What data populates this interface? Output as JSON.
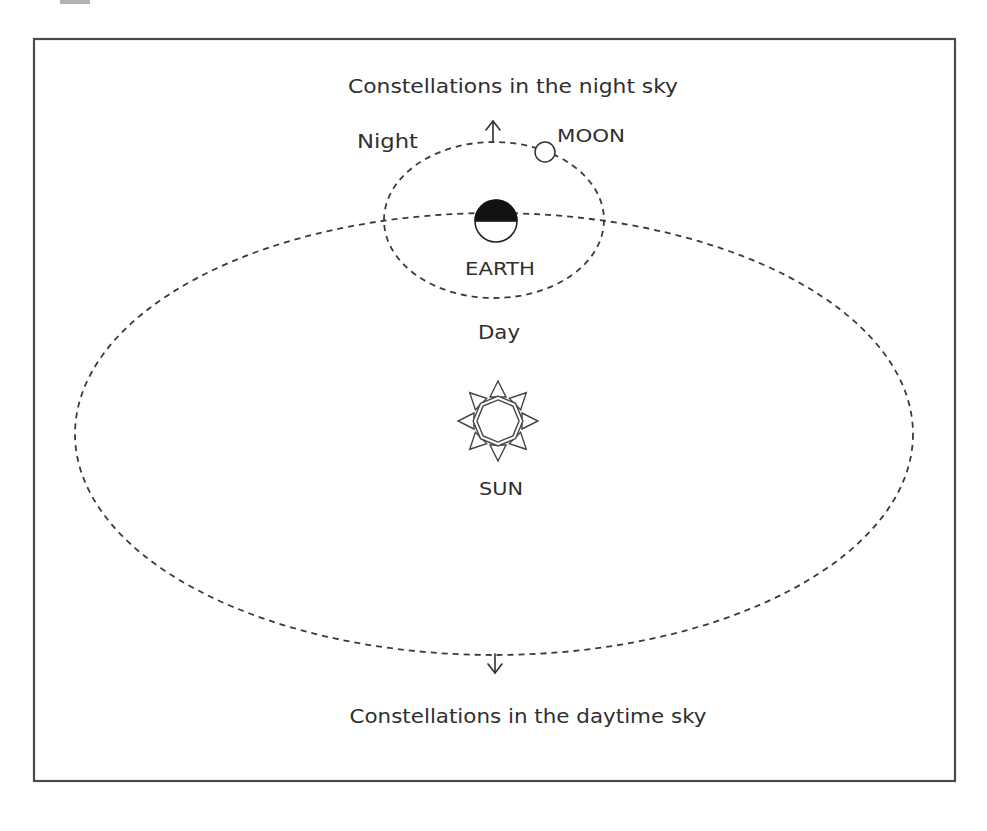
{
  "diagram": {
    "title_top": "Constellations in the night sky",
    "title_bottom": "Constellations in the daytime sky",
    "labels": {
      "night": "Night",
      "day": "Day",
      "moon": "MOON",
      "earth": "EARTH",
      "sun": "SUN"
    },
    "icons": {
      "sun": "sun-icon",
      "earth": "earth-icon",
      "moon": "moon-icon",
      "arrow_up": "arrow-up-icon",
      "arrow_down": "arrow-down-icon"
    },
    "colors": {
      "stroke": "#3a3a3a",
      "text": "#2f2f2f",
      "earth_night_side": "#111111",
      "background": "#ffffff"
    }
  }
}
